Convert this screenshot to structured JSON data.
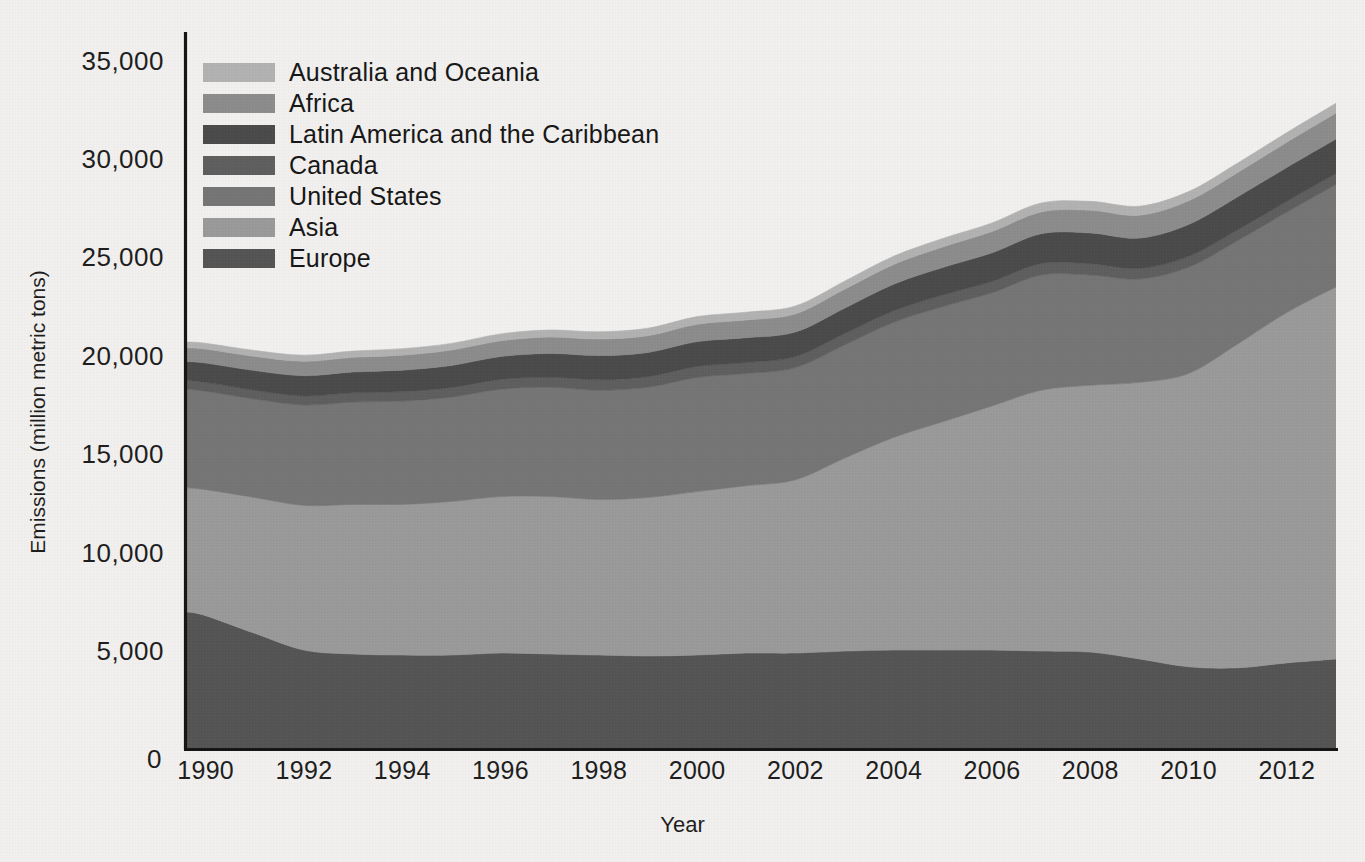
{
  "chart": {
    "type": "area",
    "title": "",
    "xlabel": "Year",
    "ylabel": "Emissions (million metric tons)"
  },
  "axes": {
    "y_ticks": [
      "35,000",
      "30,000",
      "25,000",
      "20,000",
      "15,000",
      "10,000",
      "5,000",
      "0"
    ],
    "x_ticks": [
      "1990",
      "1992",
      "1994",
      "1996",
      "1998",
      "2000",
      "2002",
      "2004",
      "2006",
      "2008",
      "2010",
      "2012"
    ]
  },
  "legend": {
    "position": "top-left",
    "items": [
      {
        "label": "Australia and Oceania",
        "color": "#b2b2b2"
      },
      {
        "label": "Africa",
        "color": "#8c8c8c"
      },
      {
        "label": "Latin America and the Caribbean",
        "color": "#4a4a4a"
      },
      {
        "label": "Canada",
        "color": "#5e5e5e"
      },
      {
        "label": "United States",
        "color": "#757575"
      },
      {
        "label": "Asia",
        "color": "#9a9a9a"
      },
      {
        "label": "Europe",
        "color": "#545454"
      }
    ]
  },
  "chart_data": {
    "type": "area",
    "stacked": true,
    "title": "",
    "xlabel": "Year",
    "ylabel": "Emissions (million metric tons)",
    "xlim": [
      1989.6,
      2013.0
    ],
    "ylim": [
      0,
      35000
    ],
    "grid": false,
    "legend_position": "top-left",
    "x": [
      1989.6,
      1990,
      1991,
      1992,
      1993,
      1994,
      1995,
      1996,
      1997,
      1998,
      1999,
      2000,
      2001,
      2002,
      2003,
      2004,
      2005,
      2006,
      2007,
      2008,
      2009,
      2010,
      2011,
      2012,
      2013
    ],
    "stack_order_bottom_to_top": [
      "Europe",
      "Asia",
      "United States",
      "Canada",
      "Latin America and the Caribbean",
      "Africa",
      "Australia and Oceania"
    ],
    "series": [
      {
        "name": "Europe",
        "color": "#545454",
        "values": [
          7000,
          6800,
          5900,
          5050,
          4850,
          4800,
          4800,
          4900,
          4850,
          4800,
          4750,
          4800,
          4900,
          4900,
          5000,
          5050,
          5050,
          5050,
          5000,
          4950,
          4600,
          4200,
          4150,
          4400,
          4600
        ]
      },
      {
        "name": "Asia",
        "color": "#9a9a9a",
        "values": [
          6300,
          6400,
          6900,
          7350,
          7600,
          7650,
          7800,
          7950,
          8000,
          7900,
          8050,
          8300,
          8500,
          8800,
          9800,
          10800,
          11600,
          12400,
          13250,
          13550,
          14050,
          14900,
          16450,
          17800,
          18900
        ]
      },
      {
        "name": "United States",
        "color": "#757575",
        "values": [
          5000,
          5000,
          5000,
          5100,
          5200,
          5250,
          5300,
          5450,
          5550,
          5550,
          5600,
          5800,
          5700,
          5700,
          5750,
          5850,
          5850,
          5750,
          5850,
          5600,
          5250,
          5400,
          5250,
          5100,
          5200
        ]
      },
      {
        "name": "Canada",
        "color": "#5e5e5e",
        "values": [
          450,
          450,
          450,
          460,
          470,
          480,
          490,
          500,
          520,
          530,
          540,
          560,
          560,
          560,
          580,
          590,
          590,
          580,
          590,
          580,
          540,
          550,
          550,
          550,
          560
        ]
      },
      {
        "name": "Latin America and the Caribbean",
        "color": "#4a4a4a",
        "values": [
          960,
          980,
          1000,
          1030,
          1060,
          1090,
          1120,
          1160,
          1200,
          1230,
          1230,
          1260,
          1260,
          1250,
          1290,
          1350,
          1400,
          1450,
          1510,
          1560,
          1540,
          1620,
          1680,
          1720,
          1750
        ]
      },
      {
        "name": "Africa",
        "color": "#8c8c8c",
        "values": [
          700,
          710,
          720,
          730,
          740,
          760,
          780,
          800,
          830,
          840,
          850,
          880,
          900,
          920,
          960,
          1000,
          1040,
          1080,
          1110,
          1150,
          1160,
          1200,
          1230,
          1280,
          1320
        ]
      },
      {
        "name": "Australia and Oceania",
        "color": "#b2b2b2",
        "values": [
          290,
          295,
          300,
          310,
          320,
          330,
          340,
          350,
          360,
          370,
          380,
          390,
          395,
          400,
          410,
          420,
          430,
          440,
          450,
          455,
          460,
          470,
          480,
          490,
          500
        ]
      }
    ],
    "totals": [
      20700,
      20635,
      20270,
      20030,
      20240,
      20360,
      20630,
      21110,
      21310,
      21220,
      21400,
      21990,
      22215,
      22530,
      23790,
      25060,
      25960,
      26750,
      27760,
      27845,
      27600,
      28340,
      29790,
      31340,
      32830
    ]
  }
}
